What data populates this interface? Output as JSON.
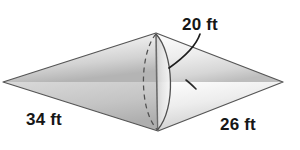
{
  "figure": {
    "name": "bicone-solid-diagram",
    "background_color": "#ffffff",
    "outline_color": "#4a4a4a",
    "fill_light": "#f2f2f2",
    "fill_mid": "#dcdcdc",
    "fill_dark": "#a8a8a8",
    "hidden_edge_style": "dashed"
  },
  "labels": {
    "radius": "20 ft",
    "left_slant": "34 ft",
    "right_slant": "26 ft"
  },
  "measurements": [
    {
      "name": "radius",
      "value": 20,
      "unit": "ft",
      "text": "20 ft"
    },
    {
      "name": "left_slant",
      "value": 34,
      "unit": "ft",
      "text": "34 ft"
    },
    {
      "name": "right_slant",
      "value": 26,
      "unit": "ft",
      "text": "26 ft"
    }
  ],
  "vertices": {
    "left": {
      "x": 3,
      "y": 82
    },
    "right": {
      "x": 283,
      "y": 82
    },
    "top": {
      "x": 156,
      "y": 33
    },
    "bottom": {
      "x": 158,
      "y": 131
    }
  }
}
